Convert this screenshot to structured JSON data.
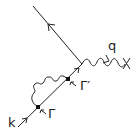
{
  "diagram": {
    "type": "feynman-diagram",
    "labels": {
      "incoming_momentum": "k",
      "photon_momentum": "q",
      "vertex_1": "Γ",
      "vertex_2": "Γ′",
      "external_marker": "X"
    },
    "colors": {
      "line": "#222222",
      "background": "#ffffff"
    }
  }
}
